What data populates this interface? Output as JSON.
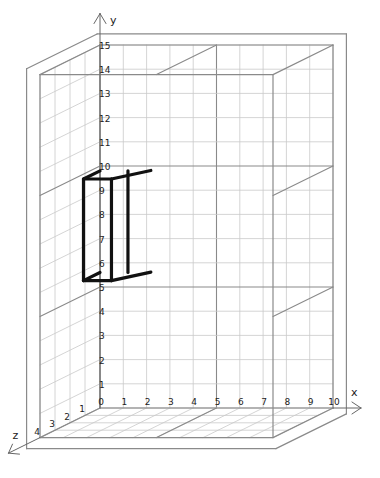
{
  "diagram": {
    "type": "3d-grid-box",
    "axes": {
      "x": {
        "label": "x",
        "min": 0,
        "max": 10,
        "ticks": [
          "0",
          "1",
          "2",
          "3",
          "4",
          "5",
          "6",
          "7",
          "8",
          "9",
          "10"
        ]
      },
      "y": {
        "label": "y",
        "min": 0,
        "max": 15,
        "ticks": [
          "1",
          "2",
          "3",
          "4",
          "5",
          "6",
          "7",
          "8",
          "9",
          "10",
          "11",
          "12",
          "13",
          "14",
          "15"
        ]
      },
      "z": {
        "label": "z",
        "min": 0,
        "max": 4,
        "ticks": [
          "1",
          "2",
          "3",
          "4"
        ]
      }
    },
    "projection": {
      "origin_px": [
        100,
        408
      ],
      "x_unit_px": [
        23.3,
        0
      ],
      "y_unit_px": [
        0,
        -24.2
      ],
      "z_unit_px": [
        -15,
        7.4
      ]
    },
    "bounding_box": {
      "x": [
        0,
        10
      ],
      "y": [
        0,
        15
      ],
      "z": [
        0,
        4
      ]
    },
    "emphasized_lines": {
      "y": [
        5,
        10
      ],
      "x": [
        5
      ]
    },
    "object": {
      "name": "black-rectangular-frame",
      "color": "#111111",
      "x": [
        0,
        1.2
      ],
      "y": [
        5.6,
        9.8
      ],
      "z": [
        0,
        1.1
      ]
    },
    "colors": {
      "grid": "#c9c9c9",
      "frame": "#8a8a8a",
      "axis": "#666666",
      "object": "#111111"
    }
  }
}
